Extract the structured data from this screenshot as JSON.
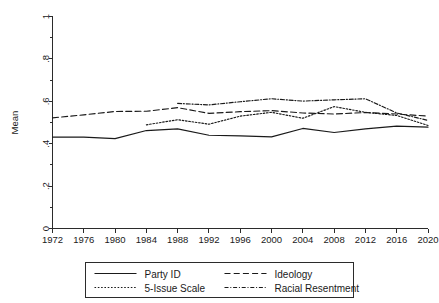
{
  "chart_data": {
    "type": "line",
    "title": "",
    "xlabel": "",
    "ylabel": "Mean",
    "xlim": [
      1972,
      2020
    ],
    "ylim": [
      0,
      1
    ],
    "grid": false,
    "legend_position": "below-axis",
    "xticks": [
      1972,
      1976,
      1980,
      1984,
      1988,
      1992,
      1996,
      2000,
      2004,
      2008,
      2012,
      2016,
      2020
    ],
    "xtick_labels": [
      "1972",
      "1976",
      "1980",
      "1984",
      "1988",
      "1992",
      "1996",
      "2000",
      "2004",
      "2008",
      "2012",
      "2016",
      "2020"
    ],
    "yticks": [
      0,
      0.2,
      0.4,
      0.6,
      0.8,
      1
    ],
    "ytick_labels": [
      "0",
      ".2",
      ".4",
      ".6",
      ".8",
      "1"
    ],
    "series": [
      {
        "name": "Party ID",
        "dash": "solid",
        "x": [
          1972,
          1976,
          1980,
          1984,
          1988,
          1992,
          1996,
          2000,
          2004,
          2008,
          2012,
          2016,
          2020
        ],
        "values": [
          0.431,
          0.431,
          0.424,
          0.462,
          0.47,
          0.44,
          0.437,
          0.432,
          0.472,
          0.453,
          0.47,
          0.483,
          0.478
        ]
      },
      {
        "name": "Ideology",
        "dash": "dashed",
        "x": [
          1972,
          1976,
          1980,
          1984,
          1988,
          1992,
          1996,
          2000,
          2004,
          2008,
          2012,
          2016,
          2020
        ],
        "values": [
          0.522,
          0.536,
          0.552,
          0.553,
          0.57,
          0.543,
          0.551,
          0.556,
          0.545,
          0.54,
          0.547,
          0.54,
          0.53
        ]
      },
      {
        "name": "5-Issue Scale",
        "dash": "dotted",
        "x": [
          1984,
          1988,
          1992,
          1996,
          2000,
          2004,
          2008,
          2012,
          2016,
          2020
        ],
        "values": [
          0.489,
          0.513,
          0.492,
          0.53,
          0.548,
          0.52,
          0.575,
          0.548,
          0.533,
          0.486
        ]
      },
      {
        "name": "Racial Resentment",
        "dash": "dashdot",
        "x": [
          1988,
          1992,
          1996,
          2000,
          2004,
          2008,
          2012,
          2016,
          2020
        ],
        "values": [
          0.59,
          0.583,
          0.598,
          0.612,
          0.601,
          0.607,
          0.612,
          0.545,
          0.51
        ]
      }
    ]
  },
  "legend": {
    "entries": [
      {
        "label": "Party ID",
        "dash": "solid"
      },
      {
        "label": "Ideology",
        "dash": "dashed"
      },
      {
        "label": "5-Issue Scale",
        "dash": "dotted"
      },
      {
        "label": "Racial Resentment",
        "dash": "dashdot"
      }
    ]
  },
  "colors": {
    "line": "#1a1a1a",
    "axis": "#2b2b2b",
    "background": "#ffffff"
  }
}
